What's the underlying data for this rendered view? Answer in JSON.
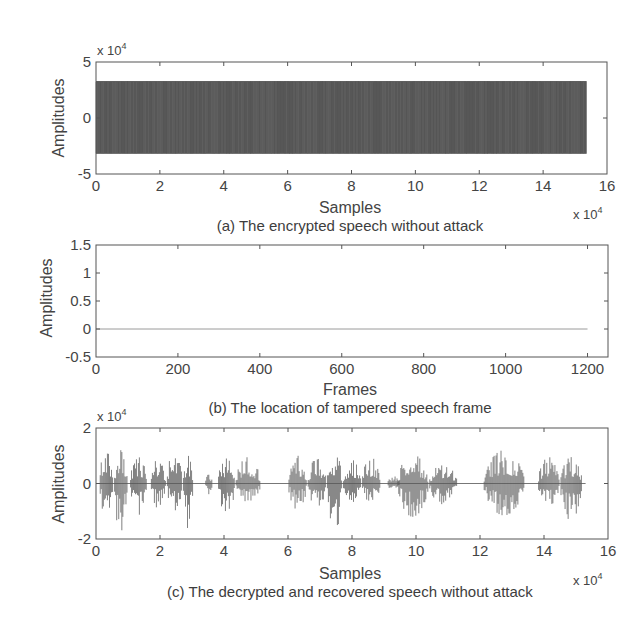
{
  "chart_data": [
    {
      "id": "a",
      "type": "line",
      "caption": "(a) The encrypted speech without attack",
      "xlabel": "Samples",
      "ylabel": "Amplitudes",
      "x_multiplier": "x 10",
      "x_multiplier_exp": "4",
      "y_multiplier": "x 10",
      "y_multiplier_exp": "4",
      "xlim": [
        0,
        16
      ],
      "ylim": [
        -5,
        5
      ],
      "xticks": [
        0,
        2,
        4,
        6,
        8,
        10,
        12,
        14,
        16
      ],
      "yticks": [
        -5,
        0,
        5
      ],
      "series": [
        {
          "name": "encrypted speech",
          "description": "uniform noise-like signal",
          "x_start": 0,
          "x_end": 15.36,
          "y_min": -3.2,
          "y_max": 3.3
        }
      ],
      "grid": false,
      "color": "#5a5a5a"
    },
    {
      "id": "b",
      "type": "line",
      "caption": "(b) The location of tampered speech frame",
      "xlabel": "Frames",
      "ylabel": "Amplitudes",
      "xlim": [
        0,
        1250
      ],
      "ylim": [
        -0.5,
        1.5
      ],
      "xticks": [
        0,
        200,
        400,
        600,
        800,
        1000,
        1200
      ],
      "yticks": [
        -0.5,
        0,
        0.5,
        1,
        1.5
      ],
      "series": [
        {
          "name": "tamper location",
          "x": [
            0,
            1200
          ],
          "y": [
            0,
            0
          ]
        }
      ],
      "grid": false,
      "color": "#9a9a9a"
    },
    {
      "id": "c",
      "type": "line",
      "caption": "(c) The decrypted and recovered speech without attack",
      "xlabel": "Samples",
      "ylabel": "Amplitudes",
      "x_multiplier": "x 10",
      "x_multiplier_exp": "4",
      "y_multiplier": "x 10",
      "y_multiplier_exp": "4",
      "xlim": [
        0,
        16
      ],
      "ylim": [
        -2,
        2
      ],
      "xticks": [
        0,
        2,
        4,
        6,
        8,
        10,
        12,
        14,
        16
      ],
      "yticks": [
        -2,
        0,
        2
      ],
      "series": [
        {
          "name": "recovered speech",
          "envelope_bursts": [
            {
              "x0": 0.1,
              "x1": 0.55,
              "pos": 1.25,
              "neg": -1.3
            },
            {
              "x0": 0.55,
              "x1": 1.0,
              "pos": 1.2,
              "neg": -1.85
            },
            {
              "x0": 1.05,
              "x1": 1.6,
              "pos": 0.95,
              "neg": -1.2
            },
            {
              "x0": 1.7,
              "x1": 2.2,
              "pos": 0.9,
              "neg": -0.9
            },
            {
              "x0": 2.2,
              "x1": 2.7,
              "pos": 1.15,
              "neg": -1.0
            },
            {
              "x0": 2.7,
              "x1": 3.05,
              "pos": 1.0,
              "neg": -1.7
            },
            {
              "x0": 3.4,
              "x1": 3.65,
              "pos": 0.4,
              "neg": -0.45
            },
            {
              "x0": 3.8,
              "x1": 4.35,
              "pos": 0.9,
              "neg": -1.3
            },
            {
              "x0": 4.35,
              "x1": 5.15,
              "pos": 0.95,
              "neg": -0.8
            },
            {
              "x0": 6.0,
              "x1": 6.6,
              "pos": 1.0,
              "neg": -0.95
            },
            {
              "x0": 6.6,
              "x1": 7.2,
              "pos": 0.9,
              "neg": -0.9
            },
            {
              "x0": 7.2,
              "x1": 7.7,
              "pos": 1.15,
              "neg": -1.8
            },
            {
              "x0": 7.7,
              "x1": 8.3,
              "pos": 0.85,
              "neg": -0.8
            },
            {
              "x0": 8.3,
              "x1": 8.9,
              "pos": 0.95,
              "neg": -0.7
            },
            {
              "x0": 9.1,
              "x1": 9.5,
              "pos": 0.3,
              "neg": -0.3
            },
            {
              "x0": 9.4,
              "x1": 10.4,
              "pos": 1.05,
              "neg": -1.2
            },
            {
              "x0": 10.4,
              "x1": 11.3,
              "pos": 0.7,
              "neg": -0.75
            },
            {
              "x0": 12.1,
              "x1": 13.4,
              "pos": 1.2,
              "neg": -1.15
            },
            {
              "x0": 13.8,
              "x1": 14.5,
              "pos": 0.95,
              "neg": -0.9
            },
            {
              "x0": 14.5,
              "x1": 15.2,
              "pos": 0.95,
              "neg": -1.35
            }
          ],
          "x_end": 15.3
        }
      ],
      "grid": false,
      "color": "#5a5a5a"
    }
  ]
}
